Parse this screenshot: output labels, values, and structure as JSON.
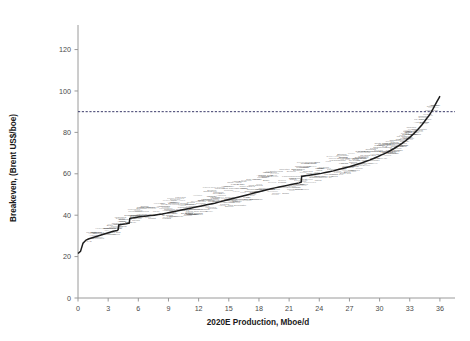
{
  "chart_data": {
    "type": "line",
    "title": "",
    "subtitle": "",
    "xlabel": "2020E Production, Mboe/d",
    "ylabel": "Breakeven, (Brent US$/boe)",
    "xlim": [
      0,
      37.5
    ],
    "ylim": [
      0,
      128
    ],
    "xticks": [
      0,
      3,
      6,
      9,
      12,
      15,
      18,
      21,
      24,
      27,
      30,
      33,
      36
    ],
    "yticks": [
      0,
      20,
      40,
      60,
      80,
      100,
      120
    ],
    "grid": false,
    "legend": null,
    "annotations": [
      {
        "type": "horizontal-reference-line",
        "value": 90,
        "style": "dashed",
        "color": "#3a3a6a",
        "label": ""
      }
    ],
    "series": [
      {
        "name": "Breakeven cost curve",
        "color": "#1c1c1c",
        "style": "step",
        "x": [
          0.0,
          0.25,
          0.5,
          0.8,
          1.1,
          1.5,
          1.9,
          2.3,
          2.7,
          3.1,
          3.5,
          3.9,
          4.0,
          4.05,
          4.4,
          4.8,
          5.1,
          5.15,
          5.2,
          5.6,
          6.0,
          6.4,
          6.8,
          7.2,
          7.6,
          8.0,
          8.4,
          8.8,
          9.2,
          9.6,
          10.0,
          10.4,
          10.8,
          11.2,
          11.6,
          12.0,
          12.4,
          12.8,
          13.2,
          13.6,
          14.0,
          14.4,
          14.8,
          15.2,
          15.6,
          16.0,
          16.4,
          16.8,
          17.2,
          17.6,
          18.0,
          18.4,
          18.8,
          19.2,
          19.6,
          20.0,
          20.4,
          20.8,
          21.2,
          21.6,
          22.0,
          22.2,
          22.25,
          22.6,
          23.0,
          23.4,
          23.8,
          24.2,
          24.6,
          25.0,
          25.4,
          25.8,
          26.2,
          26.6,
          27.0,
          27.4,
          27.8,
          28.2,
          28.6,
          29.0,
          29.4,
          29.8,
          30.2,
          30.6,
          31.0,
          31.4,
          31.8,
          32.2,
          32.6,
          33.0,
          33.4,
          33.8,
          34.2,
          34.5,
          34.7,
          34.9,
          35.1,
          35.3,
          35.5,
          35.7,
          35.9,
          36.0
        ],
        "y": [
          21.5,
          22.5,
          26.5,
          28.0,
          28.6,
          29.2,
          29.8,
          30.4,
          31.0,
          31.6,
          32.2,
          32.6,
          33.0,
          35.3,
          35.6,
          35.9,
          36.2,
          38.3,
          38.5,
          38.8,
          39.1,
          39.4,
          39.6,
          39.8,
          40.0,
          40.3,
          40.6,
          41.0,
          41.4,
          41.8,
          42.2,
          42.6,
          43.0,
          43.4,
          43.8,
          44.2,
          44.6,
          45.0,
          45.4,
          45.8,
          46.3,
          46.8,
          47.3,
          47.8,
          48.3,
          48.8,
          49.3,
          49.8,
          50.3,
          50.8,
          51.3,
          51.8,
          52.3,
          52.8,
          53.2,
          53.6,
          54.0,
          54.4,
          54.8,
          55.2,
          55.6,
          55.9,
          58.7,
          59.0,
          59.3,
          59.6,
          59.9,
          60.2,
          60.6,
          61.0,
          61.4,
          61.9,
          62.4,
          62.9,
          63.4,
          64.0,
          64.6,
          65.2,
          65.9,
          66.6,
          67.4,
          68.2,
          69.1,
          70.0,
          71.0,
          72.1,
          73.3,
          74.6,
          76.0,
          77.6,
          79.4,
          81.4,
          83.6,
          85.5,
          86.8,
          88.0,
          89.5,
          91.2,
          93.0,
          94.8,
          96.5,
          97.5
        ]
      }
    ],
    "point_labels": [
      "Kuwait",
      "Saudi Arabia",
      "Iraq",
      "Iran",
      "UAE",
      "Qatar",
      "Russia",
      "Abu Dhabi",
      "Norway",
      "Algeria",
      "Libya",
      "Nigeria",
      "Angola",
      "Kazakhstan",
      "Azerbaijan",
      "Oman",
      "Egypt",
      "Malaysia",
      "Indonesia",
      "Brunei",
      "Vietnam",
      "India",
      "China",
      "Brazil",
      "Mexico",
      "Venezuela",
      "Colombia",
      "Ecuador",
      "Argentina",
      "Canada",
      "US Onshore",
      "US GoM",
      "UK North Sea",
      "Netherlands",
      "Denmark",
      "Australia",
      "Papua New Guinea",
      "Thailand",
      "Turkmenistan",
      "Uzbekistan",
      "Bolivia",
      "Peru",
      "Chad",
      "Sudan",
      "Gabon",
      "Congo",
      "Equatorial Guinea",
      "Ghana",
      "Cameroon",
      "Ivory Coast",
      "Mauritania",
      "Tunisia",
      "Syria",
      "Yemen",
      "Bahrain",
      "Pakistan",
      "Bangladesh",
      "Myanmar",
      "Philippines",
      "New Zealand",
      "Trinidad",
      "Cuba",
      "Guatemala",
      "Suriname",
      "Guyana",
      "Romania",
      "Italy",
      "Germany",
      "Poland",
      "Ukraine",
      "Croatia",
      "Hungary",
      "Serbia",
      "Austria",
      "France",
      "Spain",
      "Turkey",
      "Greece",
      "Albania",
      "Bulgaria",
      "Czech Republic",
      "Slovakia",
      "Japan",
      "South Korea",
      "Taiwan",
      "Mongolia",
      "Kyrgyzstan",
      "Tajikistan",
      "Georgia",
      "Armenia",
      "Belarus",
      "Lithuania",
      "Latvia",
      "Estonia",
      "Moldova",
      "Slovenia",
      "Bosnia",
      "Montenegro",
      "Macedonia",
      "Kosovo",
      "Iceland",
      "Ireland",
      "Portugal",
      "Belgium",
      "Luxembourg",
      "Switzerland",
      "Sweden",
      "Finland",
      "Norway Offshore",
      "Barents Sea",
      "Kara Sea",
      "Sakhalin",
      "Yamal",
      "Timan-Pechora",
      "West Siberia",
      "East Siberia",
      "Caspian",
      "Black Sea",
      "Mediterranean",
      "Red Sea",
      "Arabian Gulf",
      "Andaman",
      "South China Sea",
      "Arctic",
      "Deepwater",
      "Ultra Deepwater",
      "Oil Sands",
      "Heavy Oil",
      "Shale Oil",
      "Tight Oil",
      "Extra Heavy",
      "Bitumen",
      "Kashagan",
      "Tengiz",
      "Karachaganak"
    ]
  },
  "axes": {
    "y_axis_title": "Breakeven, (Brent US$/boe)",
    "x_axis_title": "2020E Production, Mboe/d",
    "y_tick_labels": [
      "0",
      "20",
      "40",
      "60",
      "80",
      "100",
      "120"
    ],
    "x_tick_labels": [
      "0",
      "3",
      "6",
      "9",
      "12",
      "15",
      "18",
      "21",
      "24",
      "27",
      "30",
      "33",
      "36"
    ]
  },
  "colors": {
    "curve": "#1c1c1c",
    "reference_line": "#3a3a6a",
    "axis": "#9a9a9a",
    "tick_text": "#4a4a4a",
    "label_text": "#4d4d4d",
    "background": "#ffffff"
  }
}
